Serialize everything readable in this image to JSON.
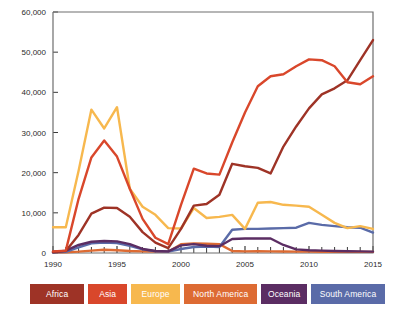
{
  "chart_data": {
    "type": "line",
    "title": "",
    "subtitle": "",
    "xlabel": "",
    "ylabel": "",
    "x": [
      1990,
      1991,
      1992,
      1993,
      1994,
      1995,
      1996,
      1997,
      1998,
      1999,
      2000,
      2001,
      2002,
      2003,
      2004,
      2005,
      2006,
      2007,
      2008,
      2009,
      2010,
      2011,
      2012,
      2013,
      2014,
      2015
    ],
    "xlim": [
      1990,
      2015
    ],
    "ylim": [
      0,
      60000
    ],
    "y_ticks": [
      0,
      10000,
      20000,
      30000,
      40000,
      50000,
      60000
    ],
    "y_tick_labels": [
      "0",
      "10,000",
      "20,000",
      "30,000",
      "40,000",
      "50,000",
      "60,000"
    ],
    "x_ticks": [
      1990,
      1995,
      2000,
      2005,
      2010,
      2015
    ],
    "x_tick_labels": [
      "1990",
      "1995",
      "2000",
      "2005",
      "2010",
      "2015"
    ],
    "x_minor_ticks": [
      1991,
      1992,
      1993,
      1994,
      1996,
      1997,
      1998,
      1999,
      2001,
      2002,
      2003,
      2004,
      2006,
      2007,
      2008,
      2009,
      2011,
      2012,
      2013,
      2014
    ],
    "grid": false,
    "legend_position": "bottom",
    "series": [
      {
        "name": "Africa",
        "color": "#9e3326",
        "values": [
          300,
          500,
          4500,
          9800,
          11300,
          11200,
          9000,
          5200,
          2600,
          1200,
          6000,
          11800,
          12200,
          14500,
          22200,
          21600,
          21200,
          19800,
          26500,
          31500,
          36000,
          39500,
          41000,
          43000,
          48000,
          53000
        ]
      },
      {
        "name": "Asia",
        "color": "#d9472b",
        "values": [
          400,
          600,
          13500,
          23800,
          28000,
          24000,
          16000,
          8500,
          3800,
          2200,
          12000,
          21000,
          19800,
          19500,
          27500,
          35000,
          41500,
          44000,
          44500,
          46500,
          48200,
          48000,
          46500,
          42500,
          42000,
          44000
        ]
      },
      {
        "name": "Europe",
        "color": "#f7b84e",
        "values": [
          6400,
          6400,
          20500,
          35700,
          31000,
          36300,
          16000,
          11500,
          9500,
          6200,
          6100,
          11200,
          8700,
          9000,
          9500,
          6000,
          12500,
          12700,
          12000,
          11800,
          11500,
          9500,
          7500,
          6200,
          6700,
          6000
        ]
      },
      {
        "name": "North America",
        "color": "#dd6b33",
        "values": [
          150,
          200,
          350,
          600,
          800,
          700,
          500,
          400,
          350,
          300,
          2200,
          2400,
          2300,
          2200,
          500,
          400,
          450,
          400,
          380,
          350,
          330,
          320,
          300,
          300,
          280,
          280
        ]
      },
      {
        "name": "Oceania",
        "color": "#5b2d63",
        "values": [
          200,
          600,
          2000,
          2800,
          3000,
          2900,
          2200,
          1000,
          500,
          400,
          1900,
          2200,
          1800,
          1700,
          3500,
          3600,
          3600,
          3600,
          2000,
          900,
          700,
          600,
          500,
          450,
          400,
          350
        ]
      },
      {
        "name": "South America",
        "color": "#5a6ba8",
        "values": [
          150,
          300,
          1400,
          2400,
          2600,
          2500,
          1800,
          900,
          450,
          350,
          1000,
          1500,
          1600,
          1500,
          5800,
          6000,
          6000,
          6100,
          6200,
          6300,
          7500,
          7000,
          6700,
          6400,
          6300,
          5100
        ]
      }
    ]
  },
  "legend": {
    "items": [
      {
        "label": "Africa",
        "color": "#9e3326",
        "width": 62
      },
      {
        "label": "Asia",
        "color": "#d9472b",
        "width": 44
      },
      {
        "label": "Europe",
        "color": "#f7b84e",
        "width": 56
      },
      {
        "label": "North America",
        "color": "#dd6b33",
        "width": 84
      },
      {
        "label": "Oceania",
        "color": "#5b2d63",
        "width": 52
      },
      {
        "label": "South America",
        "color": "#5a6ba8",
        "width": 85
      }
    ]
  },
  "axes": {
    "frame_color": "#6e6e6e",
    "tick_color": "#3a3a3a",
    "label_color": "#2b2b2b"
  }
}
